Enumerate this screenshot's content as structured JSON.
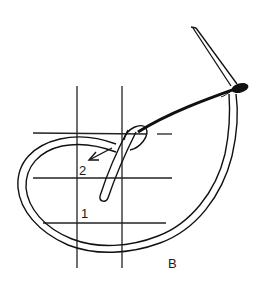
{
  "figure": {
    "type": "stitch-diagram",
    "panel_label": "B",
    "points": [
      {
        "id": "2",
        "label": "2"
      },
      {
        "id": "1",
        "label": "1"
      }
    ],
    "colors": {
      "ink": "#111111",
      "grid": "#222222",
      "background": "#ffffff"
    },
    "elements": {
      "grid": {
        "vertical_lines": 2,
        "horizontal_lines": 3
      },
      "needle": "needle-icon",
      "thread": "thread-loop",
      "arrow": "arrow-to-point-2"
    }
  }
}
